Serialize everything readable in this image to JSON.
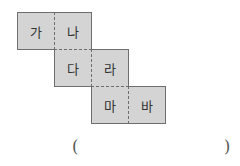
{
  "net": {
    "faces": [
      {
        "label": "가"
      },
      {
        "label": "나"
      },
      {
        "label": "다"
      },
      {
        "label": "라"
      },
      {
        "label": "마"
      },
      {
        "label": "바"
      }
    ]
  },
  "answer": {
    "open_paren": "(",
    "close_paren": ")",
    "value": ""
  }
}
